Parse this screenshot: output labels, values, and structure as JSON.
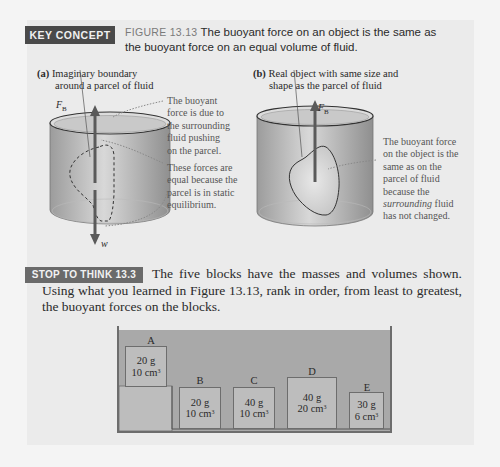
{
  "key_concept": {
    "label": "KEY CONCEPT",
    "figure_number": "FIGURE 13.13",
    "caption": "The buoyant force on an object is the same as the buoyant force on an equal volume of fluid."
  },
  "figure_a": {
    "part_label": "(a)",
    "caption_line1": "Imaginary boundary",
    "caption_line2": "around a parcel of fluid",
    "force_up_label": "F",
    "force_up_subscript": "B",
    "force_down_label": "w",
    "note_1": [
      "The buoyant",
      "force is due to",
      "the surrounding",
      "fluid pushing",
      "on the parcel."
    ],
    "note_2": [
      "These forces are",
      "equal because the",
      "parcel is in static",
      "equilibrium."
    ]
  },
  "figure_b": {
    "part_label": "(b)",
    "caption_line1": "Real object with same size and",
    "caption_line2": "shape as the parcel of fluid",
    "force_up_label": "F",
    "force_up_subscript": "B",
    "note_lines": [
      "The buoyant force",
      "on the object is the",
      "same as on the",
      "parcel of fluid",
      "because the"
    ],
    "note_italic": "surrounding",
    "note_after_italic": " fluid",
    "note_last": "has not changed."
  },
  "stop_to_think": {
    "label": "STOP TO THINK 13.3",
    "text": "The five blocks have the masses and volumes shown. Using what you learned in Figure 13.13, rank in order, from least to greatest, the buoyant forces on the blocks."
  },
  "blocks": [
    {
      "letter": "A",
      "mass": "20 g",
      "volume": "10 cm",
      "volume_unit_exp": "3"
    },
    {
      "letter": "B",
      "mass": "20 g",
      "volume": "10 cm",
      "volume_unit_exp": "3"
    },
    {
      "letter": "C",
      "mass": "40 g",
      "volume": "10 cm",
      "volume_unit_exp": "3"
    },
    {
      "letter": "D",
      "mass": "40 g",
      "volume": "20 cm",
      "volume_unit_exp": "3"
    },
    {
      "letter": "E",
      "mass": "30 g",
      "volume": "6 cm",
      "volume_unit_exp": "3"
    }
  ],
  "colors": {
    "key_concept_bg": "#4a4a4a",
    "stop_to_think_bg": "#6a6a6a",
    "panel_bg": "#ebebeb",
    "fluid": "#a9a9a9",
    "block": "#bdbdbd"
  }
}
